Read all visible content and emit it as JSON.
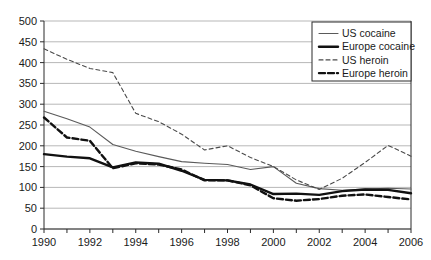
{
  "chart_data": {
    "type": "line",
    "title": "",
    "xlabel": "",
    "ylabel": "",
    "xlim": [
      1990,
      2006
    ],
    "ylim": [
      0,
      500
    ],
    "grid": true,
    "legend_position": "top-right",
    "y_ticks": [
      0,
      50,
      100,
      150,
      200,
      250,
      300,
      350,
      400,
      450,
      500
    ],
    "y_tick_labels": [
      "0",
      "50",
      "100",
      "150",
      "200",
      "250",
      "300",
      "350",
      "400",
      "450",
      "500"
    ],
    "x": [
      1990,
      1991,
      1992,
      1993,
      1994,
      1995,
      1996,
      1997,
      1998,
      1999,
      2000,
      2001,
      2002,
      2003,
      2004,
      2005,
      2006
    ],
    "x_ticks": [
      1990,
      1991,
      1992,
      1993,
      1994,
      1995,
      1996,
      1997,
      1998,
      1999,
      2000,
      2001,
      2002,
      2003,
      2004,
      2005,
      2006
    ],
    "x_tick_labels": [
      "1990",
      "",
      "1992",
      "",
      "1994",
      "",
      "1996",
      "",
      "1998",
      "",
      "2000",
      "",
      "2002",
      "",
      "2004",
      "",
      "2006"
    ],
    "x_labeled_ticks": [
      "1990",
      "1992",
      "1994",
      "1996",
      "1998",
      "2000",
      "2002",
      "2004",
      "2006"
    ],
    "series": [
      {
        "name": "US cocaine",
        "style": "thin-solid",
        "color": "#5a5a5a",
        "width": 1.1,
        "dash": "none",
        "values": [
          283,
          265,
          245,
          203,
          187,
          174,
          162,
          158,
          155,
          143,
          150,
          110,
          97,
          93,
          96,
          98,
          96
        ]
      },
      {
        "name": "Europe cocaine",
        "style": "thick-solid",
        "color": "#111111",
        "width": 2.4,
        "dash": "none",
        "values": [
          180,
          174,
          170,
          148,
          160,
          157,
          140,
          118,
          117,
          107,
          84,
          85,
          82,
          91,
          95,
          94,
          86
        ]
      },
      {
        "name": "US heroin",
        "style": "thin-dashed",
        "color": "#4a4a4a",
        "width": 1.1,
        "dash": "4,3",
        "values": [
          433,
          408,
          386,
          376,
          278,
          258,
          228,
          190,
          200,
          172,
          150,
          118,
          95,
          122,
          160,
          201,
          175
        ]
      },
      {
        "name": "Europe heroin",
        "style": "thick-dashed",
        "color": "#111111",
        "width": 2.4,
        "dash": "6,3",
        "values": [
          268,
          220,
          212,
          146,
          158,
          155,
          143,
          117,
          117,
          105,
          74,
          68,
          72,
          80,
          83,
          77,
          71
        ]
      }
    ]
  },
  "legend": {
    "items": [
      {
        "label": "US cocaine"
      },
      {
        "label": "Europe cocaine"
      },
      {
        "label": "US heroin"
      },
      {
        "label": "Europe heroin"
      }
    ]
  }
}
